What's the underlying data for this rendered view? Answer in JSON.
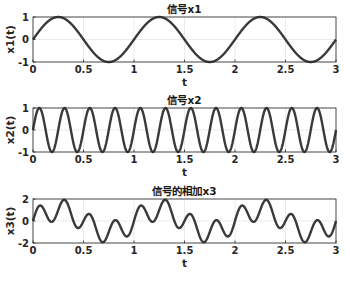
{
  "chart_data": [
    {
      "type": "line",
      "title": "信号x1",
      "xlabel": "t",
      "ylabel": "x1(t)",
      "xlim": [
        0,
        3
      ],
      "ylim": [
        -1,
        1
      ],
      "xticks": [
        "0",
        "0.5",
        "1",
        "1.5",
        "2",
        "2.5",
        "3"
      ],
      "yticks": [
        "-1",
        "0",
        "1"
      ],
      "grid": true,
      "formula": "sin(2*pi*1*t)",
      "frequency_hz": 1,
      "amplitude": 1,
      "series": [
        {
          "name": "x1",
          "color": "#3a3a3a"
        }
      ],
      "box": {
        "x0": 33,
        "x1": 336,
        "y0": 17,
        "y1": 62
      }
    },
    {
      "type": "line",
      "title": "信号x2",
      "xlabel": "t",
      "ylabel": "x2(t)",
      "xlim": [
        0,
        3
      ],
      "ylim": [
        -1,
        1
      ],
      "xticks": [
        "0",
        "0.5",
        "1",
        "1.5",
        "2",
        "2.5",
        "3"
      ],
      "yticks": [
        "-1",
        "0",
        "1"
      ],
      "grid": true,
      "formula": "sin(2*pi*4*t)",
      "frequency_hz": 4,
      "amplitude": 1,
      "series": [
        {
          "name": "x2",
          "color": "#3a3a3a"
        }
      ],
      "box": {
        "x0": 33,
        "x1": 336,
        "y0": 108,
        "y1": 152
      }
    },
    {
      "type": "line",
      "title": "信号的相加x3",
      "xlabel": "t",
      "ylabel": "x3(t)",
      "xlim": [
        0,
        3
      ],
      "ylim": [
        -2,
        2
      ],
      "xticks": [
        "0",
        "0.5",
        "1",
        "1.5",
        "2",
        "2.5",
        "3"
      ],
      "yticks": [
        "-2",
        "0",
        "2"
      ],
      "grid": true,
      "formula": "x1 + x2",
      "components": [
        "x1",
        "x2"
      ],
      "series": [
        {
          "name": "x3",
          "color": "#3a3a3a"
        }
      ],
      "box": {
        "x0": 33,
        "x1": 336,
        "y0": 199,
        "y1": 243
      }
    }
  ]
}
